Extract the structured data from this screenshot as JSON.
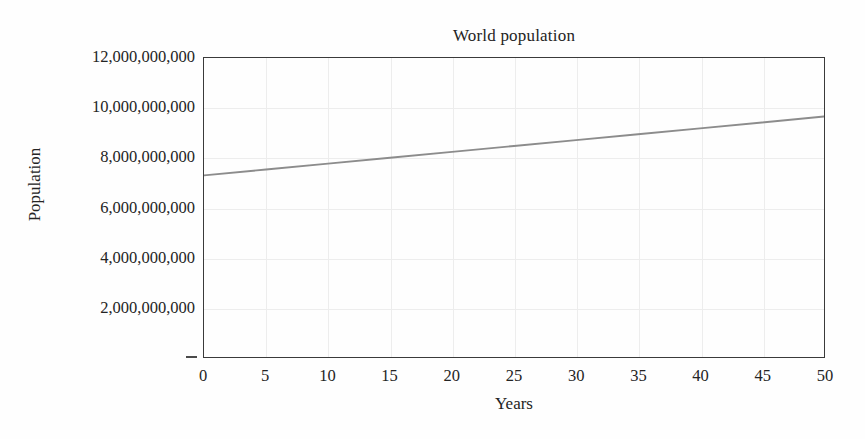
{
  "chart_data": {
    "type": "line",
    "title": "World population",
    "xlabel": "Years",
    "ylabel": "Population",
    "xlim": [
      0,
      50
    ],
    "ylim": [
      0,
      12000000000
    ],
    "grid": true,
    "legend": null,
    "x_ticks": [
      0,
      5,
      10,
      15,
      20,
      25,
      30,
      35,
      40,
      45,
      50
    ],
    "x_tick_labels": [
      "0",
      "5",
      "10",
      "15",
      "20",
      "25",
      "30",
      "35",
      "40",
      "45",
      "50"
    ],
    "y_ticks": [
      0,
      2000000000,
      4000000000,
      6000000000,
      8000000000,
      10000000000,
      12000000000
    ],
    "y_tick_labels": [
      "",
      "2,000,000,000",
      "4,000,000,000",
      "6,000,000,000",
      "8,000,000,000",
      "10,000,000,000",
      "12,000,000,000"
    ],
    "series": [
      {
        "name": "World population",
        "color": "#8c8c8c",
        "x": [
          0,
          5,
          10,
          15,
          20,
          25,
          30,
          35,
          40,
          45,
          50
        ],
        "values": [
          7290000000,
          7525000000,
          7760000000,
          7995000000,
          8230000000,
          8470000000,
          8705000000,
          8940000000,
          9175000000,
          9410000000,
          9650000000
        ]
      }
    ]
  },
  "axes": {
    "y_zero_tick_mark": "dash",
    "frame_color": "#3a3a3a",
    "grid_color": "#ededed"
  }
}
